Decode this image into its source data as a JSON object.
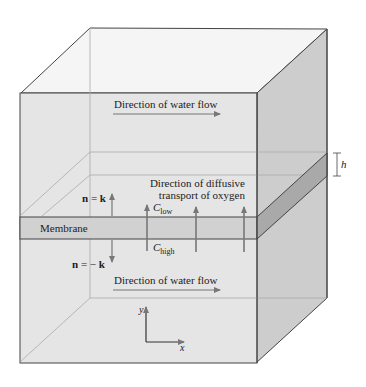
{
  "diagram": {
    "labels": {
      "water_flow_top": "Direction of water flow",
      "water_flow_bottom": "Direction of water flow",
      "diffusive_line1": "Direction of diffusive",
      "diffusive_line2": "transport of oxygen",
      "membrane": "Membrane",
      "n_up_n": "n",
      "n_up_eq": " = ",
      "n_up_k": "k",
      "n_down_n": "n",
      "n_down_eq": " = − ",
      "n_down_k": "k",
      "c_low_c": "C",
      "c_low_sub": "low",
      "c_high_c": "C",
      "c_high_sub": "high",
      "h": "h",
      "axis_y": "y",
      "axis_x": "x"
    },
    "colors": {
      "front_face": "#e4e4e4",
      "top_face": "#f4f4f4",
      "right_face": "#cdcdcd",
      "membrane_front": "#d0d0d0",
      "membrane_right": "#a9a9a9",
      "edge": "#444444",
      "arrow": "#777777"
    }
  }
}
